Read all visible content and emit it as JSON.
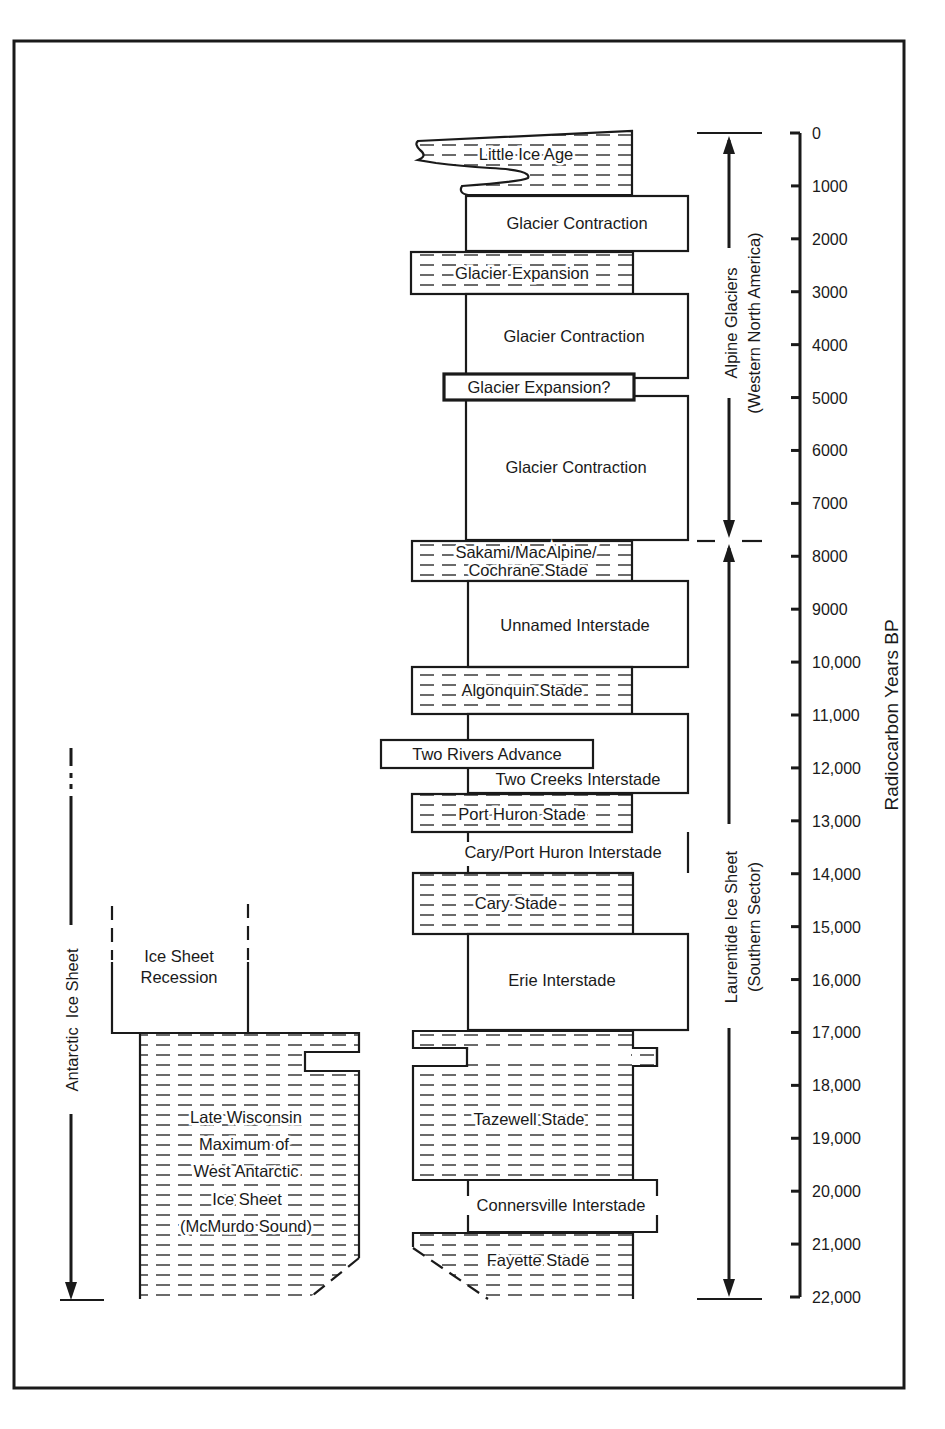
{
  "figure": {
    "axis": {
      "title": "Radiocarbon Years BP",
      "ticks": [
        "0",
        "1000",
        "2000",
        "3000",
        "4000",
        "5000",
        "6000",
        "7000",
        "8000",
        "9000",
        "10,000",
        "11,000",
        "12,000",
        "13,000",
        "14,000",
        "15,000",
        "16,000",
        "17,000",
        "18,000",
        "19,000",
        "20,000",
        "21,000",
        "22,000"
      ]
    },
    "brackets": {
      "alpine": {
        "line1": "Alpine Glaciers",
        "line2": "(Western North America)"
      },
      "laurentide": {
        "line1": "Laurentide Ice Sheet",
        "line2": "(Southern Sector)"
      },
      "antarctic": {
        "label": "Antarctic  Ice Sheet"
      }
    },
    "alpine_units": [
      {
        "label": "Little Ice Age",
        "type": "stade"
      },
      {
        "label": "Glacier Contraction",
        "type": "interstade"
      },
      {
        "label": "Glacier Expansion",
        "type": "stade"
      },
      {
        "label": "Glacier Contraction",
        "type": "interstade"
      },
      {
        "label": "Glacier Expansion?",
        "type": "stade"
      },
      {
        "label": "Glacier Contraction",
        "type": "interstade"
      }
    ],
    "laurentide_units": [
      {
        "label": "Sakami/MacAlpine/",
        "label2": "Cochrane Stade",
        "type": "stade"
      },
      {
        "label": "Unnamed Interstade",
        "type": "interstade"
      },
      {
        "label": "Algonquin Stade",
        "type": "stade"
      },
      {
        "label": "Two Rivers Advance",
        "type": "stade"
      },
      {
        "label": "Two Creeks Interstade",
        "type": "interstade"
      },
      {
        "label": "Port Huron Stade",
        "type": "stade"
      },
      {
        "label": "Cary/Port Huron Interstade",
        "type": "interstade"
      },
      {
        "label": "Cary Stade",
        "type": "stade"
      },
      {
        "label": "Erie Interstade",
        "type": "interstade"
      },
      {
        "label": "Tazewell Stade",
        "type": "stade"
      },
      {
        "label": "Connersville Interstade",
        "type": "interstade"
      },
      {
        "label": "Fayette Stade",
        "type": "stade"
      }
    ],
    "antarctic_units": [
      {
        "label": "Ice Sheet",
        "label2": "Recession",
        "type": "interstade"
      },
      {
        "lines": [
          "Late Wisconsin",
          "Maximum of",
          "West Antarctic",
          "Ice Sheet",
          "(McMurdo Sound)"
        ],
        "type": "stade"
      }
    ]
  },
  "chart_data": {
    "type": "table",
    "ylabel": "Radiocarbon Years BP",
    "ylim": [
      0,
      22000
    ],
    "columns": [
      {
        "name": "Alpine Glaciers (Western North America)",
        "range": [
          0,
          7700
        ],
        "events": [
          {
            "label": "Little Ice Age",
            "type": "stade",
            "from": 0,
            "to": 1200
          },
          {
            "label": "Glacier Contraction",
            "type": "interstade",
            "from": 1200,
            "to": 2300
          },
          {
            "label": "Glacier Expansion",
            "type": "stade",
            "from": 2300,
            "to": 3000
          },
          {
            "label": "Glacier Contraction",
            "type": "interstade",
            "from": 3000,
            "to": 4600
          },
          {
            "label": "Glacier Expansion?",
            "type": "stade",
            "from": 4600,
            "to": 4950
          },
          {
            "label": "Glacier Contraction",
            "type": "interstade",
            "from": 4950,
            "to": 7700
          }
        ]
      },
      {
        "name": "Laurentide Ice Sheet (Southern Sector)",
        "range": [
          7700,
          22000
        ],
        "events": [
          {
            "label": "Sakami/MacAlpine/Cochrane Stade",
            "type": "stade",
            "from": 7700,
            "to": 8450
          },
          {
            "label": "Unnamed Interstade",
            "type": "interstade",
            "from": 8450,
            "to": 10150
          },
          {
            "label": "Algonquin Stade",
            "type": "stade",
            "from": 10150,
            "to": 10950
          },
          {
            "label": "Two Rivers Advance",
            "type": "stade",
            "from": 11500,
            "to": 12000
          },
          {
            "label": "Two Creeks Interstade",
            "type": "interstade",
            "from": 10950,
            "to": 12550
          },
          {
            "label": "Port Huron Stade",
            "type": "stade",
            "from": 12550,
            "to": 13300
          },
          {
            "label": "Cary/Port Huron Interstade",
            "type": "interstade",
            "from": 13300,
            "to": 14000
          },
          {
            "label": "Cary Stade",
            "type": "stade",
            "from": 14000,
            "to": 15150
          },
          {
            "label": "Erie Interstade",
            "type": "interstade",
            "from": 15150,
            "to": 17000
          },
          {
            "label": "Tazewell Stade",
            "type": "stade",
            "from": 17000,
            "to": 19850
          },
          {
            "label": "Connersville Interstade",
            "type": "interstade",
            "from": 19850,
            "to": 20800
          },
          {
            "label": "Fayette Stade",
            "type": "stade",
            "from": 20800,
            "to": 22000
          }
        ]
      },
      {
        "name": "Antarctic Ice Sheet",
        "range": [
          11500,
          22000
        ],
        "events": [
          {
            "label": "Ice Sheet Recession",
            "type": "interstade",
            "from": 14600,
            "to": 17000
          },
          {
            "label": "Late Wisconsin Maximum of West Antarctic Ice Sheet (McMurdo Sound)",
            "type": "stade",
            "from": 17000,
            "to": 22000
          }
        ]
      }
    ]
  }
}
